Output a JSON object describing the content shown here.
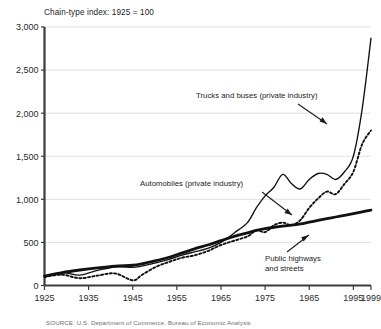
{
  "chart_data": {
    "type": "line",
    "title": "Chain-type index: 1925 = 100",
    "xlabel": "",
    "ylabel": "",
    "xlim": [
      1925,
      1999
    ],
    "ylim": [
      0,
      3000
    ],
    "grid": "horizontal",
    "legend_position": "inline-annotations",
    "yticks": [
      0,
      500,
      1000,
      1500,
      2000,
      2500,
      3000
    ],
    "ytick_labels": [
      "0",
      "500",
      "1,000",
      "1,500",
      "2,000",
      "2,500",
      "3,000"
    ],
    "xticks": [
      1925,
      1935,
      1945,
      1955,
      1965,
      1975,
      1985,
      1995,
      1999
    ],
    "xtick_labels": [
      "1925",
      "1935",
      "1945",
      "1955",
      "1965",
      "1975",
      "1985",
      "1995",
      "1999"
    ],
    "series": [
      {
        "name": "Trucks and buses (private industry)",
        "style": "thin-solid",
        "color": "#111111",
        "x": [
          1925,
          1929,
          1933,
          1937,
          1941,
          1945,
          1947,
          1950,
          1953,
          1956,
          1959,
          1962,
          1965,
          1968,
          1971,
          1973,
          1975,
          1977,
          1979,
          1981,
          1983,
          1985,
          1987,
          1989,
          1991,
          1993,
          1995,
          1997,
          1999
        ],
        "values": [
          100,
          150,
          120,
          175,
          215,
          210,
          225,
          260,
          300,
          350,
          390,
          430,
          500,
          610,
          730,
          900,
          1040,
          1140,
          1290,
          1180,
          1120,
          1230,
          1300,
          1290,
          1230,
          1320,
          1500,
          2050,
          2870
        ]
      },
      {
        "name": "Automobiles (private industry)",
        "style": "dotted",
        "color": "#111111",
        "x": [
          1925,
          1929,
          1933,
          1937,
          1941,
          1945,
          1947,
          1950,
          1953,
          1956,
          1959,
          1962,
          1965,
          1968,
          1971,
          1973,
          1975,
          1977,
          1979,
          1981,
          1983,
          1985,
          1987,
          1989,
          1991,
          1993,
          1995,
          1997,
          1999
        ],
        "values": [
          100,
          125,
          85,
          115,
          140,
          60,
          120,
          210,
          270,
          320,
          350,
          400,
          470,
          520,
          570,
          640,
          620,
          700,
          730,
          700,
          760,
          900,
          1010,
          1090,
          1060,
          1180,
          1320,
          1640,
          1800
        ]
      },
      {
        "name": "Public highways and streets",
        "style": "thick-solid",
        "color": "#111111",
        "x": [
          1925,
          1929,
          1933,
          1937,
          1941,
          1945,
          1947,
          1950,
          1953,
          1956,
          1959,
          1962,
          1965,
          1968,
          1971,
          1973,
          1975,
          1977,
          1979,
          1981,
          1983,
          1985,
          1987,
          1989,
          1991,
          1993,
          1995,
          1997,
          1999
        ],
        "values": [
          110,
          150,
          180,
          205,
          225,
          235,
          250,
          285,
          325,
          375,
          425,
          470,
          520,
          570,
          610,
          640,
          660,
          675,
          690,
          700,
          715,
          735,
          755,
          775,
          795,
          815,
          835,
          855,
          875
        ]
      }
    ],
    "annotations": [
      {
        "text": "Trucks and buses (private industry)",
        "target_series": "Trucks and buses (private industry)"
      },
      {
        "text": "Automobiles (private industry)",
        "target_series": "Automobiles (private industry)"
      },
      {
        "text": "Public highways",
        "target_series": "Public highways and streets"
      },
      {
        "text": "and streets",
        "target_series": "Public highways and streets"
      }
    ]
  },
  "figure": {
    "title": "Chain-type index: 1925 = 100",
    "source_note": "SOURCE: U.S. Department of Commerce, Bureau of Economic Analysis",
    "annot_trucks": "Trucks and buses (private industry)",
    "annot_autos": "Automobiles (private industry)",
    "annot_highways_line1": "Public highways",
    "annot_highways_line2": "and streets"
  }
}
